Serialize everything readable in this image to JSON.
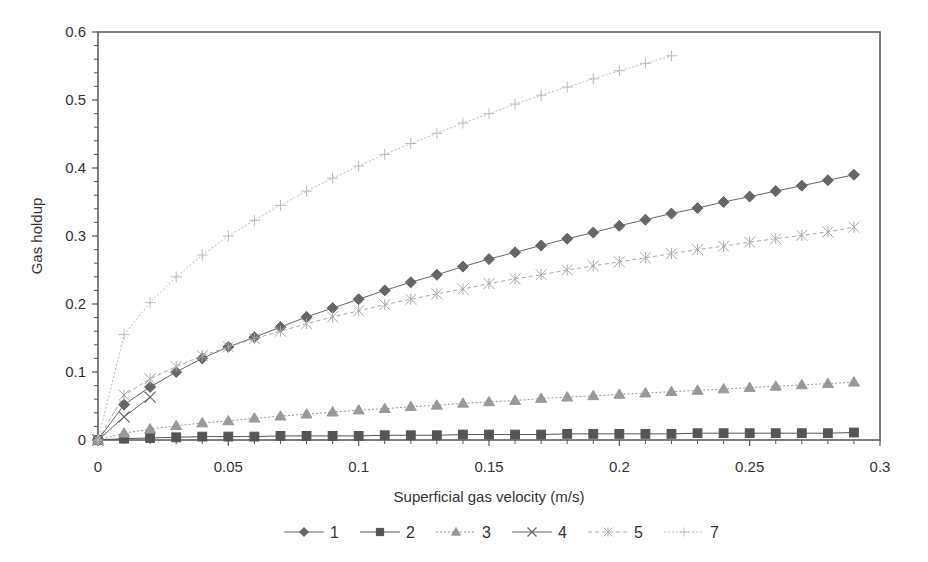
{
  "chart_data": {
    "type": "line",
    "title": "",
    "xlabel": "Superficial gas velocity (m/s)",
    "ylabel": "Gas holdup",
    "xlim": [
      0,
      0.3
    ],
    "ylim": [
      0,
      0.6
    ],
    "xticks": [
      "0",
      "0.05",
      "0.1",
      "0.15",
      "0.2",
      "0.25",
      "0.3"
    ],
    "yticks": [
      "0",
      "0.1",
      "0.2",
      "0.3",
      "0.4",
      "0.5",
      "0.6"
    ],
    "grid": false,
    "legend_position": "bottom",
    "series": [
      {
        "name": "1",
        "marker": "diamond",
        "color": "#666666",
        "dash": "",
        "x": [
          0,
          0.01,
          0.02,
          0.03,
          0.04,
          0.05,
          0.06,
          0.07,
          0.08,
          0.09,
          0.1,
          0.11,
          0.12,
          0.13,
          0.14,
          0.15,
          0.16,
          0.17,
          0.18,
          0.19,
          0.2,
          0.21,
          0.22,
          0.23,
          0.24,
          0.25,
          0.26,
          0.27,
          0.28,
          0.29
        ],
        "y": [
          0,
          0.052,
          0.078,
          0.1,
          0.12,
          0.137,
          0.151,
          0.166,
          0.181,
          0.194,
          0.207,
          0.22,
          0.232,
          0.243,
          0.255,
          0.266,
          0.276,
          0.286,
          0.296,
          0.305,
          0.315,
          0.324,
          0.333,
          0.341,
          0.35,
          0.358,
          0.366,
          0.374,
          0.382,
          0.39
        ]
      },
      {
        "name": "2",
        "marker": "square",
        "color": "#555555",
        "dash": "",
        "x": [
          0,
          0.01,
          0.02,
          0.03,
          0.04,
          0.05,
          0.06,
          0.07,
          0.08,
          0.09,
          0.1,
          0.11,
          0.12,
          0.13,
          0.14,
          0.15,
          0.16,
          0.17,
          0.18,
          0.19,
          0.2,
          0.21,
          0.22,
          0.23,
          0.24,
          0.25,
          0.26,
          0.27,
          0.28,
          0.29
        ],
        "y": [
          0,
          0.002,
          0.003,
          0.004,
          0.005,
          0.005,
          0.005,
          0.006,
          0.006,
          0.006,
          0.006,
          0.007,
          0.007,
          0.007,
          0.008,
          0.008,
          0.008,
          0.008,
          0.009,
          0.009,
          0.009,
          0.009,
          0.009,
          0.01,
          0.01,
          0.01,
          0.01,
          0.01,
          0.01,
          0.011
        ]
      },
      {
        "name": "3",
        "marker": "triangle",
        "color": "#999999",
        "dash": "2,2",
        "x": [
          0,
          0.01,
          0.02,
          0.03,
          0.04,
          0.05,
          0.06,
          0.07,
          0.08,
          0.09,
          0.1,
          0.11,
          0.12,
          0.13,
          0.14,
          0.15,
          0.16,
          0.17,
          0.18,
          0.19,
          0.2,
          0.21,
          0.22,
          0.23,
          0.24,
          0.25,
          0.26,
          0.27,
          0.28,
          0.29
        ],
        "y": [
          0,
          0.01,
          0.016,
          0.021,
          0.025,
          0.028,
          0.032,
          0.035,
          0.038,
          0.041,
          0.044,
          0.046,
          0.049,
          0.051,
          0.054,
          0.056,
          0.058,
          0.061,
          0.063,
          0.065,
          0.067,
          0.069,
          0.071,
          0.073,
          0.075,
          0.077,
          0.079,
          0.081,
          0.083,
          0.085
        ]
      },
      {
        "name": "4",
        "marker": "x",
        "color": "#666666",
        "dash": "",
        "x": [
          0,
          0.01,
          0.02
        ],
        "y": [
          0,
          0.034,
          0.063
        ]
      },
      {
        "name": "5",
        "marker": "asterisk",
        "color": "#aaaaaa",
        "dash": "4,3",
        "x": [
          0,
          0.01,
          0.02,
          0.03,
          0.04,
          0.05,
          0.06,
          0.07,
          0.08,
          0.09,
          0.1,
          0.11,
          0.12,
          0.13,
          0.14,
          0.15,
          0.16,
          0.17,
          0.18,
          0.19,
          0.2,
          0.21,
          0.22,
          0.23,
          0.24,
          0.25,
          0.26,
          0.27,
          0.28,
          0.29
        ],
        "y": [
          0,
          0.066,
          0.09,
          0.108,
          0.124,
          0.137,
          0.149,
          0.16,
          0.171,
          0.181,
          0.19,
          0.199,
          0.207,
          0.215,
          0.222,
          0.23,
          0.237,
          0.243,
          0.25,
          0.256,
          0.262,
          0.268,
          0.274,
          0.28,
          0.285,
          0.291,
          0.296,
          0.301,
          0.306,
          0.313
        ]
      },
      {
        "name": "7",
        "marker": "plus",
        "color": "#bbbbbb",
        "dash": "2,2",
        "x": [
          0,
          0.01,
          0.02,
          0.03,
          0.04,
          0.05,
          0.06,
          0.07,
          0.08,
          0.09,
          0.1,
          0.11,
          0.12,
          0.13,
          0.14,
          0.15,
          0.16,
          0.17,
          0.18,
          0.19,
          0.2,
          0.21,
          0.22
        ],
        "y": [
          0,
          0.155,
          0.202,
          0.24,
          0.272,
          0.3,
          0.323,
          0.345,
          0.366,
          0.385,
          0.403,
          0.42,
          0.436,
          0.451,
          0.466,
          0.48,
          0.494,
          0.507,
          0.519,
          0.531,
          0.543,
          0.554,
          0.565
        ]
      }
    ]
  }
}
